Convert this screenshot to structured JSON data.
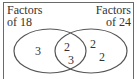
{
  "diagram": {
    "type": "venn",
    "sets": [
      {
        "id": "left",
        "label_line1": "Factors",
        "label_line2": "of 18"
      },
      {
        "id": "right",
        "label_line1": "Factors",
        "label_line2": "of 24"
      }
    ],
    "regions": {
      "left_only": [
        "3"
      ],
      "intersection": [
        "2",
        "3"
      ],
      "right_only": [
        "2",
        "2"
      ]
    },
    "colors": {
      "stroke": "#555555",
      "text": "#333333",
      "background": "#ffffff"
    }
  }
}
